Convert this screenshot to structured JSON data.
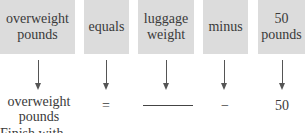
{
  "diagram": {
    "boxes": [
      {
        "label": "overweight pounds",
        "line1": "overweight",
        "line2": "pounds"
      },
      {
        "label": "equals"
      },
      {
        "label": "luggage weight",
        "line1": "luggage",
        "line2": "weight"
      },
      {
        "label": "minus"
      },
      {
        "label": "50 pounds",
        "line1": "50",
        "line2": "pounds"
      }
    ],
    "results": [
      {
        "line1": "overweight",
        "line2": "pounds"
      },
      {
        "text": "="
      },
      {
        "text": "______"
      },
      {
        "text": "−"
      },
      {
        "text": "50"
      }
    ],
    "footer_partial": "Finish with"
  },
  "colors": {
    "box_fill": "#dcdcdc",
    "text": "#3a3a3a",
    "arrow": "#555555"
  }
}
